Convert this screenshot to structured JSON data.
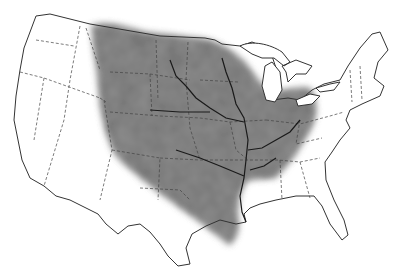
{
  "map": {
    "subject": "United States outline map with shaded Mississippi River drainage basin",
    "colors": {
      "background": "#ffffff",
      "outline": "#333333",
      "basin_fill": "#8a8a8a",
      "river": "#1a1a1a"
    }
  }
}
